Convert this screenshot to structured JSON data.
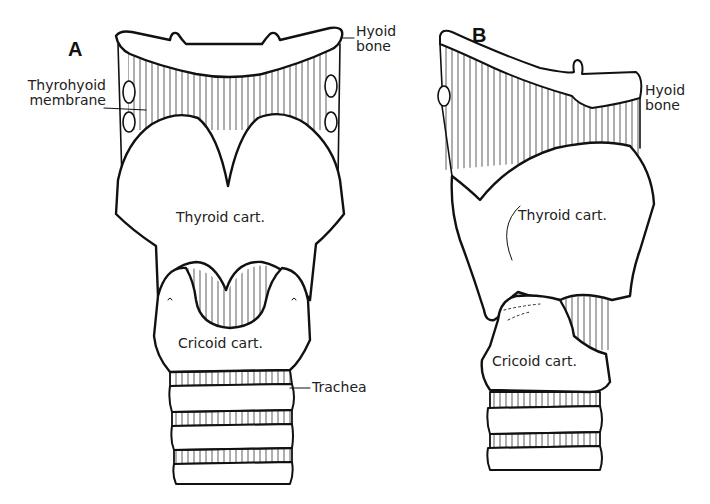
{
  "figure": {
    "panels": [
      {
        "letter": "A",
        "view": "anterior",
        "labels": {
          "hyoid_line1": "Hyoid",
          "hyoid_line2": "bone",
          "thyrohyoid_line1": "Thyrohyoid",
          "thyrohyoid_line2": "membrane",
          "thyroid": "Thyroid cart.",
          "cricoid": "Cricoid cart.",
          "trachea": "Trachea"
        }
      },
      {
        "letter": "B",
        "view": "lateral",
        "labels": {
          "hyoid_line1": "Hyoid",
          "hyoid_line2": "bone",
          "thyroid": "Thyroid cart.",
          "cricoid": "Cricoid cart."
        }
      }
    ],
    "colors": {
      "ink": "#111111",
      "paper": "#ffffff"
    }
  }
}
